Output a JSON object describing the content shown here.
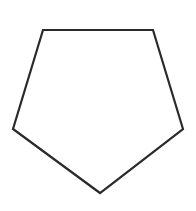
{
  "canvas": {
    "width": 196,
    "height": 211,
    "background": "#ffffff"
  },
  "shape": {
    "type": "pentagon",
    "orientation": "inverted (flat top, pointed bottom)",
    "points": "43,30 153,30 183,129 100,193 13,129",
    "stroke": "#2a2a2a",
    "stroke_width": 2.2,
    "fill": "none"
  }
}
